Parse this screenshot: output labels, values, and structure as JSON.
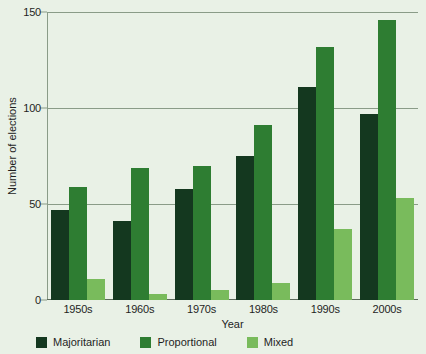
{
  "chart_data": {
    "type": "bar",
    "title": "",
    "xlabel": "Year",
    "ylabel": "Number of elections",
    "categories": [
      "1950s",
      "1960s",
      "1970s",
      "1980s",
      "1990s",
      "2000s"
    ],
    "series": [
      {
        "name": "Majoritarian",
        "color": "#14381f",
        "values": [
          47,
          41,
          58,
          75,
          111,
          97
        ]
      },
      {
        "name": "Proportional",
        "color": "#2e7d32",
        "values": [
          59,
          69,
          70,
          91,
          132,
          146
        ]
      },
      {
        "name": "Mixed",
        "color": "#79bb5c",
        "values": [
          11,
          3,
          5,
          9,
          37,
          53
        ]
      }
    ],
    "ylim": [
      0,
      150
    ],
    "yticks": [
      0,
      50,
      100,
      150
    ],
    "ytick_labels": [
      "0",
      "50",
      "100",
      "150"
    ],
    "grid": true,
    "legend_position": "bottom",
    "background_color": "#e9f1e6",
    "grid_color": "#8a9c88"
  }
}
